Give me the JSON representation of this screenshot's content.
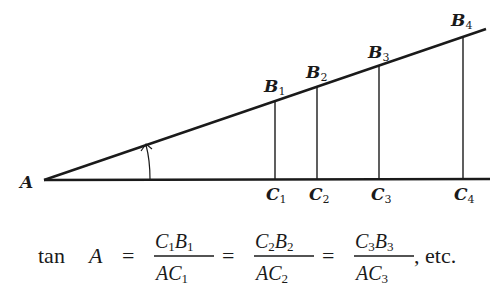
{
  "diagram": {
    "vertex_label": "A",
    "points_B": [
      {
        "name": "B",
        "sub": "1"
      },
      {
        "name": "B",
        "sub": "2"
      },
      {
        "name": "B",
        "sub": "3"
      },
      {
        "name": "B",
        "sub": "4"
      }
    ],
    "points_C": [
      {
        "name": "C",
        "sub": "1"
      },
      {
        "name": "C",
        "sub": "2"
      },
      {
        "name": "C",
        "sub": "3"
      },
      {
        "name": "C",
        "sub": "4"
      }
    ],
    "line_color": "#1a1a1a"
  },
  "formula": {
    "func": "tan",
    "angle": "A",
    "equals": "=",
    "fractions": [
      {
        "num_a": "C",
        "num_a_sub": "1",
        "num_b": "B",
        "num_b_sub": "1",
        "den_a": "A",
        "den_b": "C",
        "den_b_sub": "1"
      },
      {
        "num_a": "C",
        "num_a_sub": "2",
        "num_b": "B",
        "num_b_sub": "2",
        "den_a": "A",
        "den_b": "C",
        "den_b_sub": "2"
      },
      {
        "num_a": "C",
        "num_a_sub": "3",
        "num_b": "B",
        "num_b_sub": "3",
        "den_a": "A",
        "den_b": "C",
        "den_b_sub": "3"
      }
    ],
    "trailing": ", etc."
  }
}
